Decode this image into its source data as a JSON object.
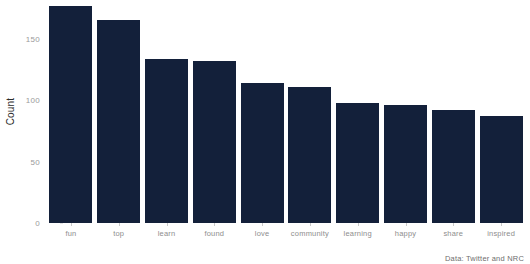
{
  "chart_data": {
    "type": "bar",
    "title": "",
    "subtitle": "",
    "xlabel": "",
    "ylabel": "Count",
    "categories": [
      "fun",
      "top",
      "learn",
      "found",
      "love",
      "community",
      "learning",
      "happy",
      "share",
      "inspired"
    ],
    "values": [
      177,
      166,
      134,
      132,
      114,
      111,
      98,
      96,
      92,
      87
    ],
    "series": [
      {
        "name": "Count",
        "values": [
          177,
          166,
          134,
          132,
          114,
          111,
          98,
          96,
          92,
          87
        ]
      }
    ],
    "ylim": [
      0,
      182
    ],
    "yticks": [
      0,
      50,
      100,
      150
    ],
    "ytick_labels": [
      "0",
      "50",
      "100",
      "150"
    ],
    "grid": false,
    "legend": "none",
    "bar_color": "#13203a",
    "background_color": "#ffffff",
    "caption": "Data: Twitter and NRC"
  },
  "axis": {
    "y_title": "Count",
    "tick_color": "#9a9a9a"
  },
  "footer": {
    "caption": "Data: Twitter and NRC"
  }
}
